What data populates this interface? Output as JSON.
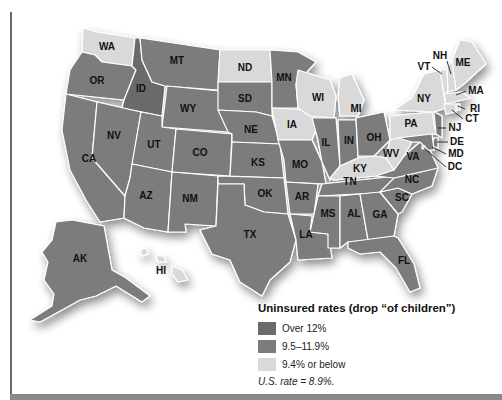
{
  "legend": {
    "title": "Uninsured rates (drop “of children”)",
    "items": [
      {
        "label": "Over 12%",
        "color": "#6b6b6b"
      },
      {
        "label": "9.5–11.9%",
        "color": "#7c7c7c"
      },
      {
        "label": "9.4% or below",
        "color": "#d9d9d9"
      }
    ],
    "us_rate": "U.S. rate = 8.9%."
  },
  "states": {
    "WA": {
      "label": "WA",
      "category": "low"
    },
    "OR": {
      "label": "OR",
      "category": "mid"
    },
    "CA": {
      "label": "CA",
      "category": "mid"
    },
    "ID": {
      "label": "ID",
      "category": "high"
    },
    "NV": {
      "label": "NV",
      "category": "mid"
    },
    "MT": {
      "label": "MT",
      "category": "mid"
    },
    "WY": {
      "label": "WY",
      "category": "mid"
    },
    "UT": {
      "label": "UT",
      "category": "mid"
    },
    "AZ": {
      "label": "AZ",
      "category": "mid"
    },
    "CO": {
      "label": "CO",
      "category": "mid"
    },
    "NM": {
      "label": "NM",
      "category": "mid"
    },
    "ND": {
      "label": "ND",
      "category": "low"
    },
    "SD": {
      "label": "SD",
      "category": "mid"
    },
    "NE": {
      "label": "NE",
      "category": "mid"
    },
    "KS": {
      "label": "KS",
      "category": "mid"
    },
    "OK": {
      "label": "OK",
      "category": "mid"
    },
    "TX": {
      "label": "TX",
      "category": "mid"
    },
    "MN": {
      "label": "MN",
      "category": "mid"
    },
    "IA": {
      "label": "IA",
      "category": "low"
    },
    "MO": {
      "label": "MO",
      "category": "mid"
    },
    "AR": {
      "label": "AR",
      "category": "mid"
    },
    "LA": {
      "label": "LA",
      "category": "mid"
    },
    "WI": {
      "label": "WI",
      "category": "low"
    },
    "IL": {
      "label": "IL",
      "category": "mid"
    },
    "MI": {
      "label": "MI",
      "category": "low"
    },
    "IN": {
      "label": "IN",
      "category": "mid"
    },
    "OH": {
      "label": "OH",
      "category": "mid"
    },
    "KY": {
      "label": "KY",
      "category": "low"
    },
    "TN": {
      "label": "TN",
      "category": "mid"
    },
    "MS": {
      "label": "MS",
      "category": "mid"
    },
    "AL": {
      "label": "AL",
      "category": "mid"
    },
    "GA": {
      "label": "GA",
      "category": "mid"
    },
    "FL": {
      "label": "FL",
      "category": "mid"
    },
    "SC": {
      "label": "SC",
      "category": "mid"
    },
    "NC": {
      "label": "NC",
      "category": "mid"
    },
    "VA": {
      "label": "VA",
      "category": "mid"
    },
    "WV": {
      "label": "WV",
      "category": "low"
    },
    "PA": {
      "label": "PA",
      "category": "low"
    },
    "NY": {
      "label": "NY",
      "category": "low"
    },
    "VT": {
      "label": "VT",
      "category": "low"
    },
    "NH": {
      "label": "NH",
      "category": "low"
    },
    "ME": {
      "label": "ME",
      "category": "low"
    },
    "MA": {
      "label": "MA",
      "category": "low"
    },
    "RI": {
      "label": "RI",
      "category": "low"
    },
    "CT": {
      "label": "CT",
      "category": "low"
    },
    "NJ": {
      "label": "NJ",
      "category": "mid"
    },
    "DE": {
      "label": "DE",
      "category": "mid"
    },
    "MD": {
      "label": "MD",
      "category": "mid"
    },
    "DC": {
      "label": "DC",
      "category": "low"
    },
    "AK": {
      "label": "AK",
      "category": "mid"
    },
    "HI": {
      "label": "HI",
      "category": "low"
    }
  },
  "category_colors": {
    "high": "#6b6b6b",
    "mid": "#7c7c7c",
    "low": "#d9d9d9"
  }
}
